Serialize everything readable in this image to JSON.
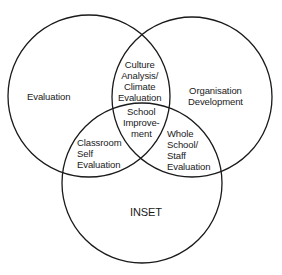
{
  "diagram": {
    "type": "venn",
    "stroke_color": "#1a1a1a",
    "circles": [
      {
        "id": "evaluation",
        "label": "Evaluation"
      },
      {
        "id": "organisation-development",
        "label_lines": [
          "Organisation",
          "Development"
        ]
      },
      {
        "id": "inset",
        "label": "INSET"
      }
    ],
    "intersections": {
      "evaluation_org": [
        "Culture",
        "Analysis/",
        "Climate",
        "Evaluation"
      ],
      "evaluation_inset": [
        "Classroom",
        "Self",
        "Evaluation"
      ],
      "org_inset": [
        "Whole",
        "School/",
        "Staff",
        "Evaluation"
      ],
      "center": [
        "School",
        "Improve-",
        "ment"
      ]
    }
  }
}
